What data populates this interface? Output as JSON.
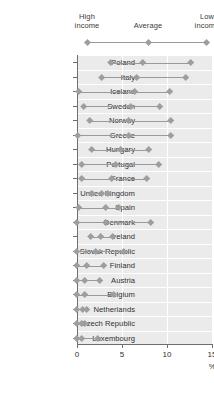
{
  "legend": {
    "items": [
      {
        "label": "High\nincome",
        "marker": "diamond-marker"
      },
      {
        "label": "Average",
        "marker": "diamond-marker"
      },
      {
        "label": "Low\nincome",
        "marker": "diamond-marker"
      }
    ],
    "high_line1": "High",
    "high_line2": "income",
    "avg_line1": "Average",
    "low_line1": "Low",
    "low_line2": "income"
  },
  "axis": {
    "ticks": [
      "0",
      "5",
      "10",
      "15"
    ],
    "unit": "%",
    "xmin": 0,
    "xmax": 15
  },
  "colors": {
    "plot_background": "#ebebeb",
    "marker": "#9e9e9e",
    "connector": "#9a9a9a",
    "gridline": "#ffffff",
    "axis": "#6e6e6e",
    "text": "#2f2f2f"
  },
  "chart_data": {
    "type": "scatter",
    "title": "",
    "xlabel": "%",
    "ylabel": "",
    "xlim": [
      0,
      15
    ],
    "xticks": [
      0,
      5,
      10,
      15
    ],
    "grid": true,
    "legend_position": "top",
    "orientation": "horizontal",
    "series": [
      {
        "name": "High income",
        "marker": "diamond"
      },
      {
        "name": "Average",
        "marker": "diamond"
      },
      {
        "name": "Low income",
        "marker": "diamond"
      }
    ],
    "categories": [
      "Poland",
      "Italy",
      "Iceland",
      "Sweden",
      "Norway",
      "Greece",
      "Hungary",
      "Portugal",
      "France",
      "United Kingdom",
      "Spain",
      "Denmark",
      "Ireland",
      "Slovak Republic",
      "Finland",
      "Austria",
      "Belgium",
      "Netherlands",
      "Czech Republic",
      "Luxembourg"
    ],
    "rows": [
      {
        "country": "Poland",
        "high": 3.7,
        "average": 7.3,
        "low": 12.6
      },
      {
        "country": "Italy",
        "high": 2.7,
        "average": 6.6,
        "low": 12.1
      },
      {
        "country": "Iceland",
        "high": 0.2,
        "average": 6.4,
        "low": 10.3
      },
      {
        "country": "Sweden",
        "high": 0.7,
        "average": 6.0,
        "low": 9.2
      },
      {
        "country": "Norway",
        "high": 1.4,
        "average": 5.7,
        "low": 10.4
      },
      {
        "country": "Greece",
        "high": 0.1,
        "average": 5.7,
        "low": 10.4
      },
      {
        "country": "Hungary",
        "high": 1.6,
        "average": 4.8,
        "low": 8.0
      },
      {
        "country": "Portugal",
        "high": 0.5,
        "average": 4.3,
        "low": 9.1
      },
      {
        "country": "France",
        "high": 0.5,
        "average": 3.9,
        "low": 7.7
      },
      {
        "country": "United Kingdom",
        "high": 1.6,
        "average": 2.7,
        "low": 3.4
      },
      {
        "country": "Spain",
        "high": 0.2,
        "average": 3.2,
        "low": 4.6
      },
      {
        "country": "Denmark",
        "high": 0.0,
        "average": 3.2,
        "low": 8.2
      },
      {
        "country": "Ireland",
        "high": 1.5,
        "average": 2.6,
        "low": 4.0
      },
      {
        "country": "Slovak Republic",
        "high": 0.0,
        "average": 2.1,
        "low": 5.2
      },
      {
        "country": "Finland",
        "high": 0.0,
        "average": 1.1,
        "low": 3.0
      },
      {
        "country": "Austria",
        "high": 0.0,
        "average": 0.9,
        "low": 2.5
      },
      {
        "country": "Belgium",
        "high": 0.0,
        "average": 0.9,
        "low": 4.1
      },
      {
        "country": "Netherlands",
        "high": 0.0,
        "average": 0.6,
        "low": 1.1
      },
      {
        "country": "Czech Republic",
        "high": 0.0,
        "average": 0.5,
        "low": 0.9
      },
      {
        "country": "Luxembourg",
        "high": 0.0,
        "average": 0.5,
        "low": 2.3
      }
    ]
  }
}
